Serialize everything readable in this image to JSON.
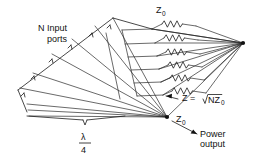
{
  "diagram": {
    "type": "line-art-schematic",
    "labels": {
      "input_ports_line1": "N  Input",
      "input_ports_line2": "ports",
      "z0_top": "Z",
      "z0_top_sub": "0",
      "z0_bottom": "Z",
      "z0_bottom_sub": "0",
      "impedance_expr": "Z = ",
      "impedance_radical": "NZ",
      "impedance_radical_sub": "0",
      "power_output_line1": "Power",
      "power_output_line2": "output",
      "lambda_numerator": "λ",
      "lambda_denominator": "4"
    },
    "colors": {
      "ink": "#1a1a1a",
      "background": "#ffffff"
    },
    "geometry": {
      "combine_node": {
        "x": 167,
        "y": 117
      },
      "output_node": {
        "x": 243,
        "y": 43
      },
      "resistor_count": 6,
      "input_port_count": 6,
      "brace": {
        "x_start": 27,
        "x_end": 125,
        "y": 118,
        "tick_x": 85
      }
    }
  }
}
